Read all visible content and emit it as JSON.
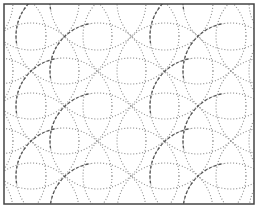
{
  "figure": {
    "title": "",
    "width": 259,
    "height": 209
  },
  "frame": {
    "x": 4,
    "y": 4,
    "width": 250,
    "height": 200,
    "stroke": "#444444",
    "stroke_width": 1.5
  },
  "style": {
    "dotted_color": "#8a8a8a",
    "dashed_color": "#555555",
    "radius": 48
  },
  "nodes": {
    "rows_y": [
      2,
      36,
      71,
      106,
      141,
      176,
      211
    ],
    "row_x_even": [
      -35,
      31,
      98,
      165,
      231,
      297
    ],
    "row_x_odd": [
      -2,
      64,
      131,
      198,
      264
    ]
  }
}
